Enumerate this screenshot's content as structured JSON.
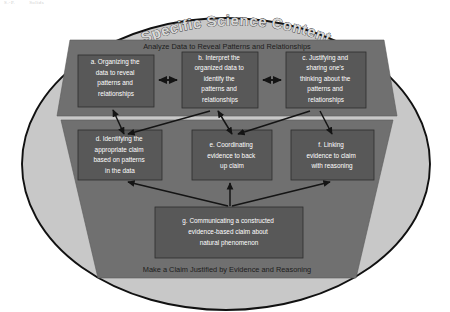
{
  "page": {
    "header_left": "S.-P.",
    "header_right": "Solids"
  },
  "diagram": {
    "title": "Specific Science Content",
    "upper_panel": {
      "banner": "Analyze Data to Reveal Patterns and Relationships",
      "boxes": [
        {
          "id": "a",
          "label": "a. Organizing the data to reveal patterns and relationships"
        },
        {
          "id": "b",
          "label": "b. Interpret the organized data to identify the patterns and relationships"
        },
        {
          "id": "c",
          "label": "c. Justifying and sharing one's thinking  about the patterns and relationships"
        }
      ]
    },
    "lower_panel": {
      "banner": "Make a Claim Justified by Evidence and Reasoning",
      "boxes": [
        {
          "id": "d",
          "label": "d. Identifying the appropriate claim based on patterns in the data"
        },
        {
          "id": "e",
          "label": "e. Coordinating evidence to back up claim"
        },
        {
          "id": "f",
          "label": "f. Linking evidence to claim with reasoning"
        },
        {
          "id": "g",
          "label": "g. Communicating a constructed evidence-based claim about natural phenomenon"
        }
      ]
    },
    "lines": {
      "a": [
        "a. Organizing the",
        "data to reveal",
        "patterns and",
        "relationships"
      ],
      "b": [
        "b. Interpret the",
        "organized data to",
        "identify the",
        "patterns and",
        "relationships"
      ],
      "c": [
        "c. Justifying and",
        "sharing one's",
        "thinking  about the",
        "patterns and",
        "relationships"
      ],
      "d": [
        "d. Identifying the",
        "appropriate claim",
        "based on patterns",
        "in the data"
      ],
      "e": [
        "e. Coordinating",
        "evidence to back",
        "up claim"
      ],
      "f": [
        "f. Linking",
        "evidence to claim",
        "with reasoning"
      ],
      "g": [
        "g. Communicating a constructed",
        "evidence-based claim about",
        "natural phenomenon"
      ]
    },
    "colors": {
      "ellipse_fill": "#c8c8c8",
      "ellipse_stroke": "#111111",
      "panel_fill": "#707070",
      "box_fill": "#585858",
      "box_stroke": "#2e2e2e",
      "arrow": "#141414",
      "box_label": "#ffffff",
      "banner_label": "#1c1c1c"
    }
  }
}
